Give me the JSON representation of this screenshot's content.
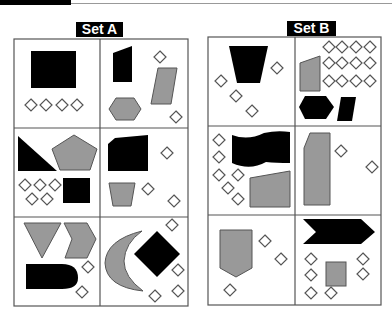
{
  "header": {
    "bar_color": "#000000"
  },
  "sets": [
    {
      "label": "Set A"
    },
    {
      "label": "Set B"
    }
  ],
  "colors": {
    "black": "#000000",
    "gray": "#999999",
    "outline": "#555555",
    "border": "#555555"
  },
  "set_a_panels": [
    {
      "id": "A1",
      "shapes": [
        "black rectangle",
        "4 small diamonds"
      ]
    },
    {
      "id": "A2",
      "shapes": [
        "black quadrilateral",
        "gray parallelogram",
        "gray hexagon",
        "2 small diamonds"
      ]
    },
    {
      "id": "A3",
      "shapes": [
        "black right triangle",
        "gray pentagon",
        "black square",
        "5 small diamonds"
      ]
    },
    {
      "id": "A4",
      "shapes": [
        "black pentagon (cut corner)",
        "gray trapezoid",
        "3 small diamonds"
      ]
    },
    {
      "id": "A5",
      "shapes": [
        "gray triangle",
        "gray chevron",
        "black bullet shape",
        "2 small diamonds"
      ]
    },
    {
      "id": "A6",
      "shapes": [
        "gray crescent",
        "black diamond",
        "4 small diamonds"
      ]
    }
  ],
  "set_b_panels": [
    {
      "id": "B1",
      "shapes": [
        "black trapezoid",
        "4 small diamonds"
      ]
    },
    {
      "id": "B2",
      "shapes": [
        "gray quadrilateral",
        "black hexagon",
        "black parallelogram",
        "12 small diamonds"
      ]
    },
    {
      "id": "B3",
      "shapes": [
        "black wave flag",
        "gray quadrilateral",
        "6 small diamonds"
      ]
    },
    {
      "id": "B4",
      "shapes": [
        "gray tall pentagon",
        "2 small diamonds"
      ]
    },
    {
      "id": "B5",
      "shapes": [
        "gray shield pentagon",
        "3 small diamonds"
      ]
    },
    {
      "id": "B6",
      "shapes": [
        "black chevron arrow",
        "gray square",
        "7 small diamonds"
      ]
    }
  ]
}
